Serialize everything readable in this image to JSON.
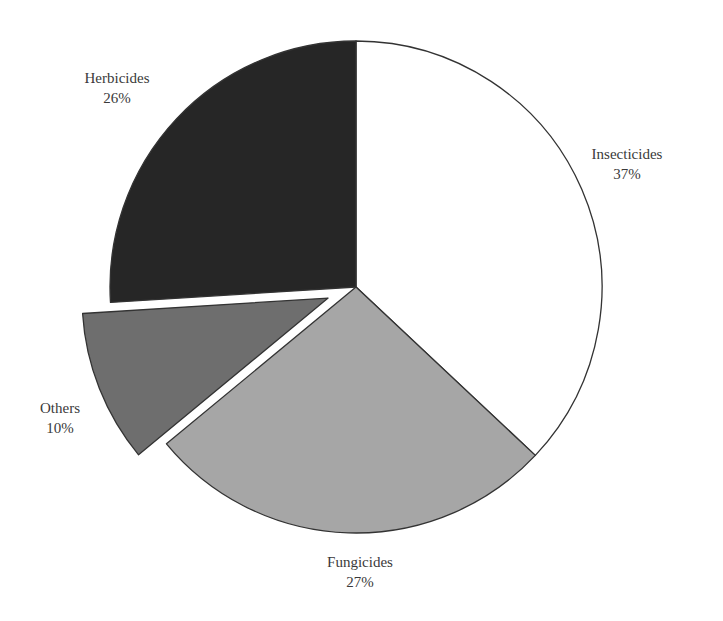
{
  "chart_data": {
    "type": "pie",
    "title": "",
    "start_angle_deg": 0,
    "direction": "clockwise",
    "slices": [
      {
        "label": "Insecticides",
        "value": 37,
        "display": "37%",
        "color": "#ffffff",
        "exploded": false
      },
      {
        "label": "Fungicides",
        "value": 27,
        "display": "27%",
        "color": "#a6a6a6",
        "exploded": false
      },
      {
        "label": "Others",
        "value": 10,
        "display": "10%",
        "color": "#6e6e6e",
        "exploded": true
      },
      {
        "label": "Herbicides",
        "value": 26,
        "display": "26%",
        "color": "#262626",
        "exploded": false
      }
    ],
    "legend": "none",
    "labels_position": "outside"
  },
  "labels": {
    "insecticides": {
      "name": "Insecticides",
      "pct": "37%"
    },
    "fungicides": {
      "name": "Fungicides",
      "pct": "27%"
    },
    "others": {
      "name": "Others",
      "pct": "10%"
    },
    "herbicides": {
      "name": "Herbicides",
      "pct": "26%"
    }
  }
}
